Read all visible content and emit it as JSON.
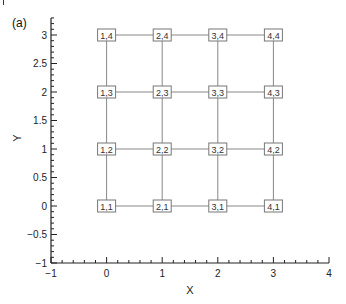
{
  "panel_label": "(a)",
  "chart_data": {
    "type": "scatter",
    "title": "",
    "panel_label": "(a)",
    "xlabel": "X",
    "ylabel": "Y",
    "xlim": [
      -1,
      4
    ],
    "ylim": [
      -1,
      3.3
    ],
    "xticks": [
      -1,
      0,
      1,
      2,
      3,
      4
    ],
    "xtick_labels": [
      "−1",
      "0",
      "1",
      "2",
      "3",
      "4"
    ],
    "yticks": [
      -1,
      -0.5,
      0,
      0.5,
      1,
      1.5,
      2,
      2.5,
      3
    ],
    "ytick_labels": [
      "−1",
      "−0.5",
      "0",
      "0.5",
      "1",
      "1.5",
      "2",
      "2.5",
      "3"
    ],
    "grid": false,
    "legend": null,
    "nodes": [
      {
        "label": "1,1",
        "x": 0,
        "y": 0
      },
      {
        "label": "2,1",
        "x": 1,
        "y": 0
      },
      {
        "label": "3,1",
        "x": 2,
        "y": 0
      },
      {
        "label": "4,1",
        "x": 3,
        "y": 0
      },
      {
        "label": "1,2",
        "x": 0,
        "y": 1
      },
      {
        "label": "2,2",
        "x": 1,
        "y": 1
      },
      {
        "label": "3,2",
        "x": 2,
        "y": 1
      },
      {
        "label": "4,2",
        "x": 3,
        "y": 1
      },
      {
        "label": "1,3",
        "x": 0,
        "y": 2
      },
      {
        "label": "2,3",
        "x": 1,
        "y": 2
      },
      {
        "label": "3,3",
        "x": 2,
        "y": 2
      },
      {
        "label": "4,3",
        "x": 3,
        "y": 2
      },
      {
        "label": "1,4",
        "x": 0,
        "y": 3
      },
      {
        "label": "2,4",
        "x": 1,
        "y": 3
      },
      {
        "label": "3,4",
        "x": 2,
        "y": 3
      },
      {
        "label": "4,4",
        "x": 3,
        "y": 3
      }
    ],
    "grid_lines": {
      "x_positions": [
        0,
        1,
        2,
        3
      ],
      "y_positions": [
        0,
        1,
        2,
        3
      ],
      "color": "#888888"
    }
  }
}
